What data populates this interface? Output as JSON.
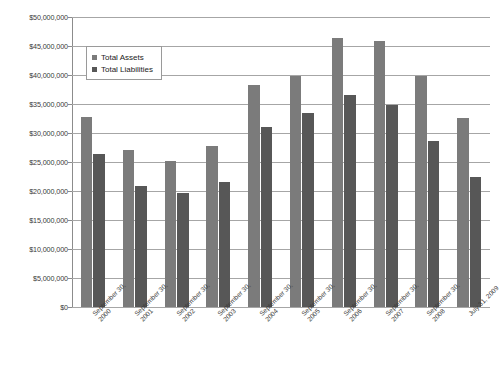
{
  "chart_data": {
    "type": "bar",
    "title": "",
    "xlabel": "",
    "ylabel": "",
    "ylim": [
      0,
      50000000
    ],
    "ytick_step": 5000000,
    "grid": true,
    "legend_position": "upper-left-inside",
    "categories": [
      "September 30, 2000",
      "September 30, 2001",
      "September 30, 2002",
      "September 30, 2003",
      "September 30, 2004",
      "September 30, 2005",
      "September 30, 2006",
      "September 30, 2007",
      "September 30, 2008",
      "July 31, 2009"
    ],
    "category_lines": [
      [
        "September 30,",
        "2000"
      ],
      [
        "September 30,",
        "2001"
      ],
      [
        "September 30,",
        "2002"
      ],
      [
        "September 30,",
        "2003"
      ],
      [
        "September 30,",
        "2004"
      ],
      [
        "September 30,",
        "2005"
      ],
      [
        "September 30,",
        "2006"
      ],
      [
        "September 30,",
        "2007"
      ],
      [
        "September 30,",
        "2008"
      ],
      [
        "July 31, 2009",
        ""
      ]
    ],
    "series": [
      {
        "name": "Total Assets",
        "color": "#7b7b7b",
        "values": [
          32700000,
          27000000,
          25200000,
          27700000,
          38200000,
          39900000,
          46300000,
          45900000,
          39800000,
          32600000
        ]
      },
      {
        "name": "Total Liabilities",
        "color": "#575757",
        "values": [
          26400000,
          20800000,
          19700000,
          21500000,
          31100000,
          33400000,
          36500000,
          34800000,
          28600000,
          22400000
        ]
      }
    ],
    "ytick_labels": [
      "$0",
      "$5,000,000",
      "$10,000,000",
      "$15,000,000",
      "$20,000,000",
      "$25,000,000",
      "$30,000,000",
      "$35,000,000",
      "$40,000,000",
      "$45,000,000",
      "$50,000,000"
    ],
    "ytick_values": [
      0,
      5000000,
      10000000,
      15000000,
      20000000,
      25000000,
      30000000,
      35000000,
      40000000,
      45000000,
      50000000
    ]
  },
  "legend": {
    "items": [
      {
        "label": "Total Assets",
        "color": "#7b7b7b"
      },
      {
        "label": "Total Liabilities",
        "color": "#575757"
      }
    ]
  }
}
